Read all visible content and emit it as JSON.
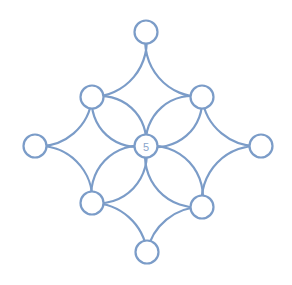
{
  "diagram": {
    "type": "flower-circle-puzzle",
    "colors": {
      "stroke": "#7b9cc8",
      "label": "#8aa6cc",
      "background": "#ffffff"
    },
    "nodes": [
      {
        "id": "top",
        "x": 146,
        "y": 32,
        "label": ""
      },
      {
        "id": "upper-left",
        "x": 92,
        "y": 97,
        "label": ""
      },
      {
        "id": "upper-right",
        "x": 202,
        "y": 97,
        "label": ""
      },
      {
        "id": "left",
        "x": 35,
        "y": 146,
        "label": ""
      },
      {
        "id": "center",
        "x": 146,
        "y": 146,
        "label": "5"
      },
      {
        "id": "right",
        "x": 261,
        "y": 146,
        "label": ""
      },
      {
        "id": "lower-left",
        "x": 92,
        "y": 203,
        "label": ""
      },
      {
        "id": "lower-right",
        "x": 202,
        "y": 207,
        "label": ""
      },
      {
        "id": "bottom",
        "x": 147,
        "y": 252,
        "label": ""
      }
    ],
    "big_circles": [
      {
        "name": "top",
        "through": [
          "upper-left",
          "top",
          "upper-right"
        ]
      },
      {
        "name": "left",
        "through": [
          "upper-left",
          "left",
          "lower-left"
        ]
      },
      {
        "name": "right",
        "through": [
          "upper-right",
          "right",
          "lower-right"
        ]
      },
      {
        "name": "bottom",
        "through": [
          "lower-left",
          "bottom",
          "lower-right"
        ]
      }
    ],
    "petals": [
      {
        "from": "center",
        "to": "upper-left"
      },
      {
        "from": "center",
        "to": "upper-right"
      },
      {
        "from": "center",
        "to": "lower-left"
      },
      {
        "from": "center",
        "to": "lower-right"
      }
    ],
    "node_radius": 11.5
  }
}
